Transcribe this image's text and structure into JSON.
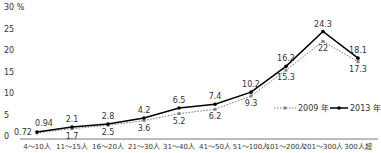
{
  "chart_data": {
    "type": "line",
    "title": "",
    "xlabel": "",
    "ylabel": "%",
    "ylim": [
      0,
      30
    ],
    "yticks": [
      0,
      5,
      10,
      15,
      20,
      25,
      30
    ],
    "ytick_labels": [
      "0",
      "5",
      "10",
      "15",
      "20",
      "25",
      "30 %"
    ],
    "grid": false,
    "legend_position": "lower right inside",
    "categories": [
      "4～10人",
      "11～15人",
      "16～20人",
      "21～30人",
      "31～40人",
      "41～50人",
      "51～100人",
      "101～200人",
      "201～300人",
      "300人超"
    ],
    "series": [
      {
        "name": "2009 年",
        "style": "dotted",
        "color": "#888888",
        "values": [
          0.72,
          1.7,
          2.5,
          3.6,
          5.2,
          6.2,
          9.3,
          15.3,
          22,
          17.3
        ]
      },
      {
        "name": "2013 年",
        "style": "solid",
        "color": "#000000",
        "values": [
          0.94,
          2.1,
          2.8,
          4.2,
          6.5,
          7.4,
          10.2,
          16.2,
          24.3,
          18.1
        ]
      }
    ]
  }
}
